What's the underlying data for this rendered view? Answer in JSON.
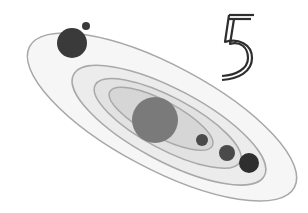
{
  "illustration": {
    "subject": "solar-system-orbits",
    "number_label": "5",
    "colors": {
      "background": "#ffffff",
      "orbit_stroke": "#a8a8a8",
      "ring_outer": "#f6f6f6",
      "ring_2": "#ececec",
      "ring_3": "#e2e2e2",
      "ring_inner": "#d6d6d6",
      "sun": "#7a7a7a",
      "planet_dark": "#3a3a3a",
      "planet_mid": "#4a4a4a",
      "number_stroke": "#2e2e2e"
    }
  }
}
